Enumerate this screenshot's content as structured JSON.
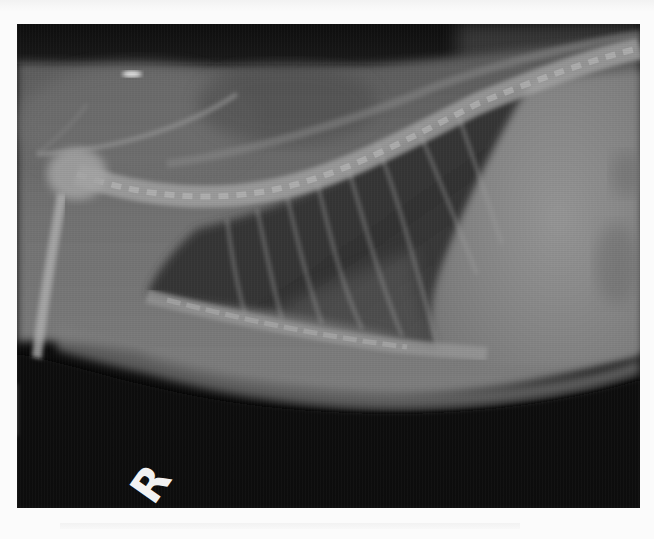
{
  "image": {
    "description": "Lateral thoracic radiograph of a cat",
    "view": "lateral",
    "marker": {
      "label": "R",
      "meaning": "right lateral positional marker"
    },
    "palette": {
      "background_dark": "#0b0b0b",
      "soft_tissue": "#6e6e6e",
      "lung_field": "#3a3a3a",
      "bone": "#a8a8a8",
      "heart_abdomen": "#8a8a8a",
      "page": "#fbfbfb"
    }
  }
}
